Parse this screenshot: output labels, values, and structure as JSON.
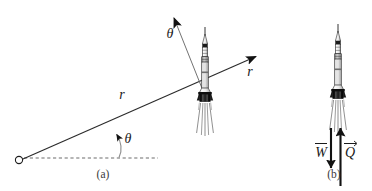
{
  "figure": {
    "type": "physics-diagram",
    "background_color": "#ffffff",
    "ink_color": "#1a1a1a",
    "rocket_body_color": "#f2f2f2",
    "rocket_dark_color": "#111111",
    "rocket_band_color": "#8a8a8a",
    "width": 372,
    "height": 191
  },
  "panel_a": {
    "caption": "(a)",
    "caption_x": 103,
    "caption_y": 178,
    "origin": {
      "x": 19,
      "y": 160,
      "radius": 3.6
    },
    "radial_line": {
      "label": "r",
      "label_x": 122,
      "label_y": 99,
      "from_x": 22,
      "from_y": 158,
      "to_x": 260,
      "to_y": 55
    },
    "r_axis_arrow": {
      "label": "r",
      "label_x": 250,
      "label_y": 76,
      "tip_x": 262,
      "tip_y": 54
    },
    "theta_axis_arrow": {
      "label": "θ",
      "label_x": 170,
      "label_y": 38,
      "tip_x": 172,
      "tip_y": 13
    },
    "theta_angle": {
      "label": "θ",
      "label_x": 128,
      "label_y": 143,
      "vertex_x": 116,
      "vertex_y": 158
    },
    "baseline": {
      "style": "dashed",
      "from_x": 24,
      "from_y": 158,
      "to_x": 158,
      "to_y": 158
    },
    "rocket": {
      "center_x": 205,
      "nose_y": 28,
      "engine_y": 103
    }
  },
  "panel_b": {
    "caption": "(b)",
    "caption_x": 334,
    "caption_y": 178,
    "rocket": {
      "center_x": 338,
      "nose_y": 25,
      "engine_y": 100
    },
    "weight_vector": {
      "label": "W",
      "symbol": "W̅",
      "label_x": 321,
      "label_y": 156,
      "direction": "down",
      "x": 331,
      "from_y": 128,
      "to_y": 170
    },
    "thrust_vector": {
      "label": "Q",
      "symbol": "Q⃗",
      "label_x": 350,
      "label_y": 156,
      "direction": "up",
      "x": 340,
      "from_y": 186,
      "to_y": 126
    }
  }
}
